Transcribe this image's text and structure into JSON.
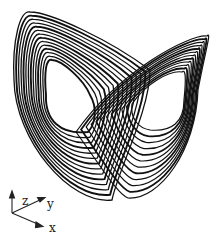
{
  "figure": {
    "stroke_color": "#111111",
    "background": "#ffffff"
  },
  "axes": {
    "z_label": "z",
    "y_label": "y",
    "x_label": "x"
  },
  "attractor": {
    "lobes": [
      {
        "name": "left-lobe",
        "center": [
          66,
          100
        ]
      },
      {
        "name": "right-lobe",
        "center": [
          160,
          102
        ]
      }
    ],
    "ring_count": 14
  }
}
